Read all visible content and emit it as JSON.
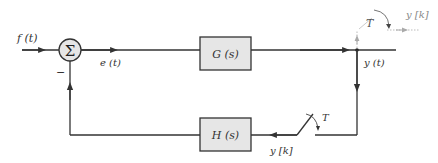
{
  "diagram": {
    "type": "block-diagram",
    "summing_junction": {
      "symbol": "Σ",
      "minus_sign": "−"
    },
    "signals": {
      "input": "f (t)",
      "error": "e (t)",
      "output": "y (t)",
      "sampled_output_top": "y [k]",
      "sampled_output_feedback": "y [k]"
    },
    "blocks": {
      "forward": "G (s)",
      "feedback": "H (s)"
    },
    "samplers": {
      "top_period": "T",
      "feedback_period": "T"
    },
    "colors": {
      "line": "#333333",
      "block_fill": "#e6e6e6",
      "sampler_top": "#999999"
    }
  }
}
